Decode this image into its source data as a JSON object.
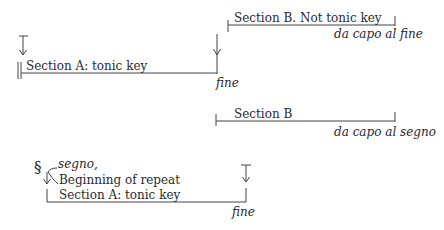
{
  "diagram": {
    "form_1": {
      "section_a": {
        "label": "Section A: tonic key",
        "end_marker": "fine"
      },
      "section_b": {
        "label": "Section B. Not tonic key",
        "end_marker": "da capo al fine"
      }
    },
    "form_2": {
      "section_b": {
        "label": "Section B",
        "end_marker": "da capo al segno"
      },
      "section_a": {
        "sign": "§",
        "sign_label": "segno,",
        "sign_description": "Beginning of repeat",
        "label": "Section A:  tonic key",
        "end_marker": "fine"
      }
    }
  }
}
